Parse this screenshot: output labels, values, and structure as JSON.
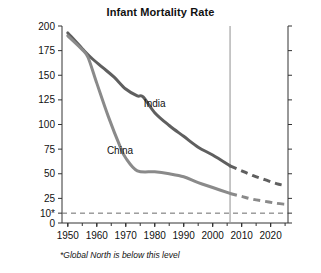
{
  "chart_data": {
    "type": "line",
    "title": "Infant Mortality Rate",
    "xlabel": "",
    "ylabel": "Deaths per 1,000 live births",
    "xlim": [
      1948,
      2026
    ],
    "ylim": [
      0,
      200
    ],
    "grid": false,
    "legend_position": "inline-annotation",
    "y_ticks": [
      0,
      10,
      25,
      50,
      75,
      100,
      125,
      150,
      175,
      200
    ],
    "y_tick_labels": [
      "0",
      "10*",
      "25",
      "50",
      "75",
      "100",
      "125",
      "150",
      "175",
      "200"
    ],
    "x_ticks": [
      1950,
      1960,
      1970,
      1980,
      1990,
      2000,
      2010,
      2020
    ],
    "x_tick_labels": [
      "1950",
      "1960",
      "1970",
      "1980",
      "1990",
      "2000",
      "2010",
      "2020"
    ],
    "x_minor_tick_interval": 5,
    "annotations": [
      {
        "text": "India",
        "x": 1980,
        "y": 118
      },
      {
        "text": "China",
        "x": 1968,
        "y": 70
      }
    ],
    "reference_lines": [
      {
        "name": "global-north-level",
        "orientation": "horizontal",
        "value": 10,
        "style": "dashed",
        "label": "10*"
      },
      {
        "name": "present-day-divider",
        "orientation": "vertical",
        "value": 2006,
        "style": "solid"
      }
    ],
    "footnote": "*Global North is below this level",
    "series": [
      {
        "name": "India",
        "color": "#5f5f5f",
        "solid_x": [
          1950,
          1955,
          1958,
          1962,
          1966,
          1970,
          1974,
          1976,
          1980,
          1985,
          1990,
          1995,
          2000,
          2006
        ],
        "solid_y": [
          193,
          177,
          168,
          158,
          148,
          136,
          129,
          128,
          112,
          99,
          88,
          77,
          69,
          58
        ],
        "projected_x": [
          2006,
          2010,
          2014,
          2018,
          2022,
          2025
        ],
        "projected_y": [
          58,
          53,
          48,
          44,
          40,
          38
        ]
      },
      {
        "name": "China",
        "color": "#8a8a8a",
        "solid_x": [
          1950,
          1955,
          1957,
          1960,
          1964,
          1968,
          1970,
          1974,
          1980,
          1985,
          1990,
          1995,
          2000,
          2006
        ],
        "solid_y": [
          190,
          176,
          168,
          142,
          108,
          78,
          66,
          53,
          52,
          50,
          47,
          41,
          36,
          30
        ],
        "projected_x": [
          2006,
          2010,
          2014,
          2018,
          2022,
          2025
        ],
        "projected_y": [
          30,
          27,
          24,
          22,
          20,
          19
        ]
      }
    ]
  }
}
